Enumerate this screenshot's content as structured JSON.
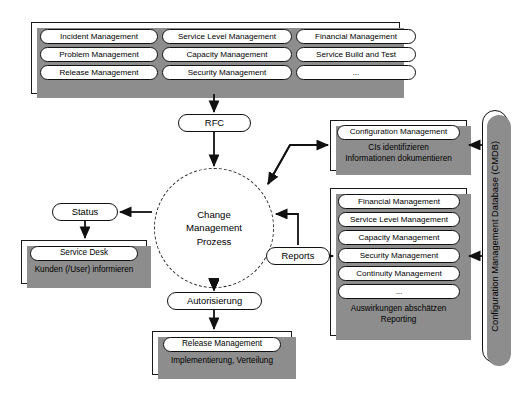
{
  "diagram": {
    "title": "Change Management Prozess",
    "language": "de",
    "accent_line": "#111111",
    "shadow_color": "#8d8d8d",
    "paper_color": "#ffffff"
  },
  "top_panel": {
    "name": "itil-processes-panel",
    "columns": [
      [
        "Incident Management",
        "Problem Management",
        "Release Management"
      ],
      [
        "Service Level Management",
        "Capacity Management",
        "Security Management"
      ],
      [
        "Financial Management",
        "Service Build and Test",
        "..."
      ]
    ]
  },
  "rfc": {
    "label": "RFC"
  },
  "process": {
    "line1": "Change",
    "line2": "Management",
    "line3": "Prozess"
  },
  "status": {
    "label": "Status"
  },
  "service_desk": {
    "pill": "Service Desk",
    "note": "Kunden (/User) informieren"
  },
  "configuration_management": {
    "pill": "Configuration Management",
    "note_line1": "CIs identifizieren",
    "note_line2": "Informationen dokumentieren"
  },
  "reports": {
    "label": "Reports"
  },
  "impact_panel": {
    "items": [
      "Financial Management",
      "Service Level Management",
      "Capacity Management",
      "Security Management",
      "Continuity Management",
      "..."
    ],
    "note_line1": "Auswirkungen abschätzen",
    "note_line2": "Reporting"
  },
  "authorization": {
    "label": "Autorisierung"
  },
  "release": {
    "pill": "Release Management",
    "note": "Implementierung, Verteilung"
  },
  "cmdb": {
    "label": "Configuration Management Database (CMDB)"
  }
}
